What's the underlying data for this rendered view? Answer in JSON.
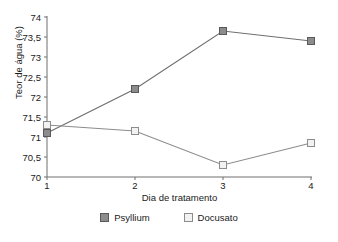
{
  "chart_data": {
    "type": "line",
    "title": "",
    "xlabel": "Dia de tratamento",
    "ylabel": "Teor de água (%)",
    "categories": [
      "1",
      "2",
      "3",
      "4"
    ],
    "x": [
      1,
      2,
      3,
      4
    ],
    "xlim": [
      1,
      4
    ],
    "ylim": [
      70,
      74
    ],
    "ytick_labels": [
      "74",
      "73,5",
      "73",
      "72,5",
      "72",
      "71,5",
      "71",
      "70,5",
      "70"
    ],
    "ytick_values": [
      74,
      73.5,
      73,
      72.5,
      72,
      71.5,
      71,
      70.5,
      70
    ],
    "xtick_labels": [
      "1",
      "2",
      "3",
      "4"
    ],
    "grid": false,
    "legend_position": "bottom-center",
    "series": [
      {
        "name": "Psyllium",
        "marker": "filled-square",
        "color": "#8c8c8c",
        "line_color": "#6e6e6e",
        "values": [
          71.1,
          72.2,
          73.65,
          73.4
        ]
      },
      {
        "name": "Docusato",
        "marker": "open-square",
        "color": "#f2f2f2",
        "line_color": "#8c8c8c",
        "values": [
          71.3,
          71.15,
          70.3,
          70.85
        ]
      }
    ]
  },
  "legend": {
    "items": [
      {
        "label": "Psyllium",
        "swatch": "filled-square-swatch"
      },
      {
        "label": "Docusato",
        "swatch": "open-square-swatch"
      }
    ]
  },
  "colors": {
    "axis": "#6e6e6e",
    "text": "#1a1a1a",
    "psyllium_fill": "#8c8c8c",
    "psyllium_stroke": "#595959",
    "docusato_fill": "#f2f2f2",
    "docusato_stroke": "#8c8c8c"
  }
}
